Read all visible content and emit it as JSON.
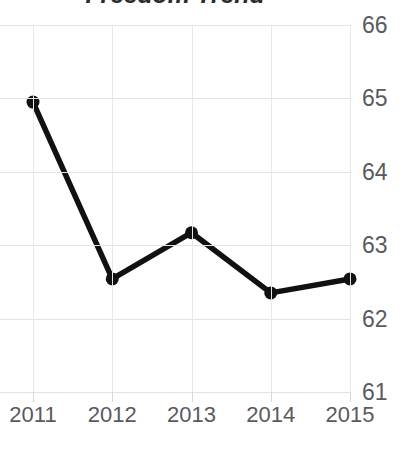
{
  "chart_data": {
    "type": "line",
    "title": "Freedom Trend",
    "xlabel": "",
    "ylabel": "",
    "categories": [
      "2011",
      "2012",
      "2013",
      "2014",
      "2015"
    ],
    "x": [
      2011,
      2012,
      2013,
      2014,
      2015
    ],
    "values": [
      64.95,
      62.54,
      63.17,
      62.35,
      62.54
    ],
    "series": [
      {
        "name": "Freedom score",
        "values": [
          64.95,
          62.54,
          63.17,
          62.35,
          62.54
        ]
      }
    ],
    "ylim": [
      61,
      66
    ],
    "yticks": [
      61,
      62,
      63,
      64,
      65,
      66
    ],
    "ytick_labels": [
      "61",
      "62",
      "63",
      "64",
      "65",
      "66"
    ],
    "xticks": [
      2011,
      2012,
      2013,
      2014,
      2015
    ],
    "xtick_labels": [
      "2011",
      "2012",
      "2013",
      "2014",
      "2015"
    ],
    "y_axis_position": "right",
    "grid": true,
    "grid_axis": "both",
    "legend": false,
    "markers": true,
    "line_color": "#111111",
    "marker_color": "#111111",
    "grid_color": "#e3e3e5",
    "text_color": "#5a5a5e",
    "title_color": "#2b2b2b",
    "background": "#ffffff"
  }
}
